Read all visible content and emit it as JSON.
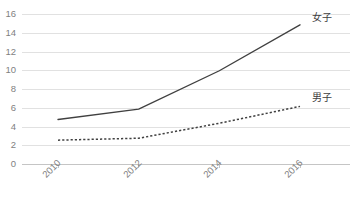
{
  "chart_data": {
    "type": "line",
    "title": "",
    "subtitle": "",
    "xlabel": "",
    "ylabel": "",
    "categories": [
      "2010",
      "2012",
      "2014",
      "2016"
    ],
    "x": [
      2010,
      2012,
      2014,
      2016
    ],
    "series": [
      {
        "name": "女子",
        "style": "solid",
        "color": "#404040",
        "values": [
          4.8,
          5.9,
          10.0,
          14.9
        ]
      },
      {
        "name": "男子",
        "style": "dashed",
        "color": "#404040",
        "values": [
          2.6,
          2.8,
          4.4,
          6.2
        ]
      }
    ],
    "ylim": [
      0,
      16
    ],
    "yticks": [
      0,
      2,
      4,
      6,
      8,
      10,
      12,
      14,
      16
    ],
    "ytick_labels": [
      "0",
      "2",
      "4",
      "6",
      "8",
      "10",
      "12",
      "14",
      "16"
    ],
    "xtick_labels": [
      "2010",
      "2012",
      "2014",
      "2016"
    ],
    "xtick_rotation": -45,
    "grid": "horizontal",
    "gridline_color": "#d9d9d9",
    "axis_color": "#bfbfbf",
    "background": "#ffffff",
    "legend_position": "inline-right-of-line-end",
    "legend_entries": [
      "女子",
      "男子"
    ]
  }
}
